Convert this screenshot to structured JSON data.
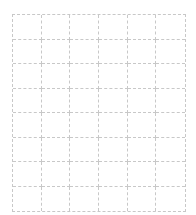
{
  "header": {
    "cropped_text": ""
  },
  "grid": {
    "columns": 6,
    "rows": 8,
    "line_color": "#c8c8c8",
    "line_style": "dashed"
  }
}
